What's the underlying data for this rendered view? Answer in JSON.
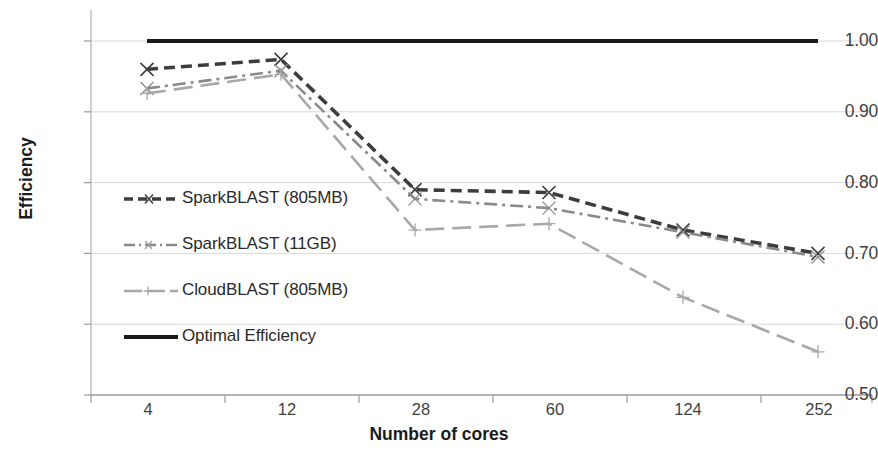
{
  "chart_data": {
    "type": "line",
    "title": "",
    "xlabel": "Number of cores",
    "ylabel": "Efficiency",
    "categories": [
      "4",
      "12",
      "28",
      "60",
      "124",
      "252"
    ],
    "ylim": [
      0.5,
      1.0
    ],
    "yticks": [
      "0.50",
      "0.60",
      "0.70",
      "0.80",
      "0.90",
      "1.00"
    ],
    "ytick_values": [
      0.5,
      0.6,
      0.7,
      0.8,
      0.9,
      1.0
    ],
    "grid": true,
    "legend_position": "inside-left",
    "series": [
      {
        "name": "SparkBLAST (805MB)",
        "values": [
          0.96,
          0.974,
          0.79,
          0.786,
          0.733,
          0.7
        ],
        "color": "#3d3d3d",
        "style": "dashed",
        "marker": "x"
      },
      {
        "name": "SparkBLAST (11GB)",
        "values": [
          0.933,
          0.958,
          0.777,
          0.764,
          0.73,
          0.695
        ],
        "color": "#8a8a8a",
        "style": "dashdot",
        "marker": "x"
      },
      {
        "name": "CloudBLAST (805MB)",
        "values": [
          0.926,
          0.953,
          0.733,
          0.742,
          0.638,
          0.561
        ],
        "color": "#a8a8a8",
        "style": "longdash",
        "marker": "plus"
      },
      {
        "name": "Optimal Efficiency",
        "values": [
          1.0,
          1.0,
          1.0,
          1.0,
          1.0,
          1.0
        ],
        "color": "#1a1a1a",
        "style": "solid",
        "marker": "none"
      }
    ]
  },
  "axes": {
    "y_title": "Efficiency",
    "x_title": "Number of cores",
    "y_labels": [
      "1.00",
      "0.90",
      "0.80",
      "0.70",
      "0.60",
      "0.50"
    ],
    "x_labels": [
      "4",
      "12",
      "28",
      "60",
      "124",
      "252"
    ]
  },
  "legend": {
    "items": [
      {
        "label": "SparkBLAST (805MB)"
      },
      {
        "label": "SparkBLAST (11GB)"
      },
      {
        "label": "CloudBLAST (805MB)"
      },
      {
        "label": "Optimal Efficiency"
      }
    ]
  }
}
